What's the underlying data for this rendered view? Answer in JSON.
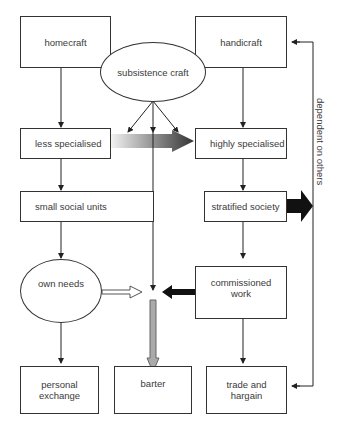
{
  "diagram": {
    "nodes": {
      "homecraft": "homecraft",
      "handicraft": "handicraft",
      "subsistence_craft": "subsistence craft",
      "less_specialised": "less specialised",
      "highly_specialised": "highly specialised",
      "small_social_units": "small social units",
      "stratified_society": "stratified society",
      "own_needs": "own needs",
      "commissioned_work": "commissioned work",
      "personal_exchange": "personal exchange",
      "barter": "barter",
      "trade_and_bargain": "trade and hargain"
    },
    "side_label": "dependent on others",
    "edges": [
      {
        "from": "homecraft",
        "to": "less specialised"
      },
      {
        "from": "handicraft",
        "to": "highly specialised"
      },
      {
        "from": "subsistence craft",
        "to": "less specialised"
      },
      {
        "from": "subsistence craft",
        "to": "central line"
      },
      {
        "from": "subsistence craft",
        "to": "highly specialised"
      },
      {
        "from": "less specialised",
        "to": "highly specialised",
        "style": "gradient block arrow"
      },
      {
        "from": "less specialised",
        "to": "small social units"
      },
      {
        "from": "highly specialised",
        "to": "stratified society"
      },
      {
        "from": "small social units",
        "to": "own needs"
      },
      {
        "from": "stratified society",
        "to": "commissioned work"
      },
      {
        "from": "stratified society",
        "to": "dependent on others",
        "style": "black block arrow"
      },
      {
        "from": "own needs",
        "to": "center",
        "style": "hollow arrow"
      },
      {
        "from": "commissioned work",
        "to": "center",
        "style": "black thick arrow"
      },
      {
        "from": "center",
        "to": "barter",
        "style": "grey hollow arrow"
      },
      {
        "from": "own needs",
        "to": "personal exchange"
      },
      {
        "from": "commissioned work",
        "to": "trade and hargain"
      },
      {
        "from": "dependent on others",
        "to": "handicraft"
      },
      {
        "from": "dependent on others",
        "to": "trade and hargain"
      }
    ]
  }
}
